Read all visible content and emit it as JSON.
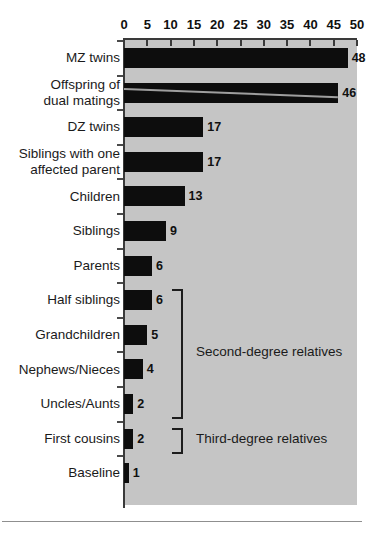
{
  "chart_data": {
    "type": "bar",
    "orientation": "horizontal",
    "title": "",
    "xlabel": "",
    "ylabel": "",
    "xlim": [
      0,
      50
    ],
    "xticks": [
      0,
      5,
      10,
      15,
      20,
      25,
      30,
      35,
      40,
      45,
      50
    ],
    "grid": false,
    "legend": null,
    "bar_color": "#0d0d0d",
    "panel_color": "#c5c5c5",
    "categories": [
      "MZ twins",
      "Offspring of\ndual matings",
      "DZ twins",
      "Siblings with one\naffected parent",
      "Children",
      "Siblings",
      "Parents",
      "Half siblings",
      "Grandchildren",
      "Nephews/Nieces",
      "Uncles/Aunts",
      "First cousins",
      "Baseline"
    ],
    "values": [
      48,
      46,
      17,
      17,
      13,
      9,
      6,
      6,
      5,
      4,
      2,
      2,
      1
    ],
    "value_labels": [
      "48",
      "46",
      "17",
      "17",
      "13",
      "9",
      "6",
      "6",
      "5",
      "4",
      "2",
      "2",
      "1"
    ],
    "annotations": [
      {
        "label": "Second-degree relatives",
        "covers": [
          "Half siblings",
          "Grandchildren",
          "Nephews/Nieces",
          "Uncles/Aunts"
        ]
      },
      {
        "label": "Third-degree relatives",
        "covers": [
          "First cousins"
        ]
      }
    ]
  }
}
